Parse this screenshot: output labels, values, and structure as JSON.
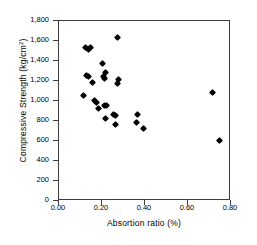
{
  "chart_data": {
    "type": "scatter",
    "title": "",
    "xlabel": "Absortion ratio (%)",
    "ylabel": "Compressive Strength (kg/cm2)",
    "ylabel_base": "Compressive Strength (kg/cm",
    "ylabel_sup": "2",
    "ylabel_tail": ")",
    "xlim": [
      0.0,
      0.8
    ],
    "ylim": [
      0,
      1800
    ],
    "xticks": [
      0.0,
      0.2,
      0.4,
      0.6,
      0.8
    ],
    "xtick_labels": [
      "0.00",
      "0.20",
      "0.40",
      "0.60",
      "0.80"
    ],
    "yticks": [
      0,
      200,
      400,
      600,
      800,
      1000,
      1200,
      1400,
      1600,
      1800
    ],
    "ytick_labels": [
      "0",
      "200",
      "400",
      "600",
      "800",
      "1,000",
      "1,200",
      "1,400",
      "1,600",
      "1,800"
    ],
    "grid": false,
    "legend": null,
    "marker": "diamond",
    "marker_color": "#000000",
    "points": [
      {
        "x": 0.125,
        "y": 1540
      },
      {
        "x": 0.135,
        "y": 1520
      },
      {
        "x": 0.145,
        "y": 1540
      },
      {
        "x": 0.27,
        "y": 1640
      },
      {
        "x": 0.13,
        "y": 1260
      },
      {
        "x": 0.135,
        "y": 1245
      },
      {
        "x": 0.155,
        "y": 1185
      },
      {
        "x": 0.2,
        "y": 1380
      },
      {
        "x": 0.215,
        "y": 1290
      },
      {
        "x": 0.205,
        "y": 1250
      },
      {
        "x": 0.21,
        "y": 1230
      },
      {
        "x": 0.275,
        "y": 1215
      },
      {
        "x": 0.27,
        "y": 1180
      },
      {
        "x": 0.115,
        "y": 1055
      },
      {
        "x": 0.165,
        "y": 1005
      },
      {
        "x": 0.175,
        "y": 985
      },
      {
        "x": 0.185,
        "y": 930
      },
      {
        "x": 0.21,
        "y": 955
      },
      {
        "x": 0.22,
        "y": 955
      },
      {
        "x": 0.215,
        "y": 830
      },
      {
        "x": 0.255,
        "y": 865
      },
      {
        "x": 0.265,
        "y": 855
      },
      {
        "x": 0.265,
        "y": 770
      },
      {
        "x": 0.365,
        "y": 870
      },
      {
        "x": 0.36,
        "y": 785
      },
      {
        "x": 0.395,
        "y": 730
      },
      {
        "x": 0.715,
        "y": 1090
      },
      {
        "x": 0.745,
        "y": 610
      }
    ]
  }
}
